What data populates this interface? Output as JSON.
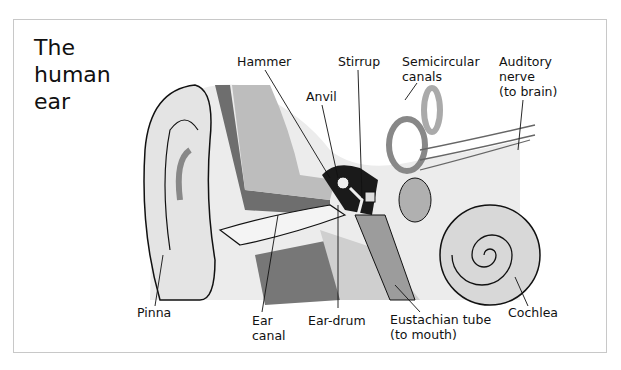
{
  "title": {
    "lines": [
      "The",
      "human",
      "ear"
    ]
  },
  "labels": {
    "hammer": "Hammer",
    "anvil": "Anvil",
    "stirrup": "Stirrup",
    "semicircular": [
      "Semicircular",
      "canals"
    ],
    "auditory": [
      "Auditory",
      "nerve",
      "(to brain)"
    ],
    "pinna": "Pinna",
    "ear_canal": [
      "Ear",
      "canal"
    ],
    "ear_drum": "Ear-drum",
    "eustachian": [
      "Eustachian tube",
      "(to mouth)"
    ],
    "cochlea": "Cochlea"
  },
  "colors": {
    "light": "#e6e6e6",
    "mid": "#b4b4b4",
    "dark": "#6e6e6e",
    "black": "#1a1a1a"
  }
}
